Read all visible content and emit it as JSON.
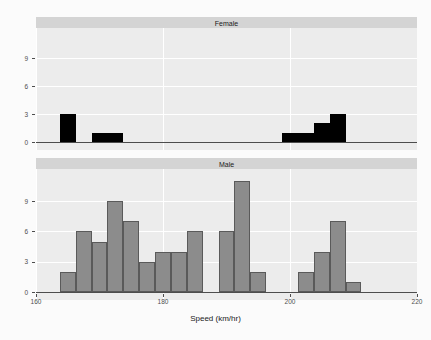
{
  "chart_data": {
    "type": "bar",
    "title": "",
    "subtitle": "",
    "xlabel": "Speed (km/hr)",
    "ylabel": "",
    "xlim": [
      160,
      220
    ],
    "ylim": [
      0,
      11.6
    ],
    "xticks": [
      160,
      180,
      200,
      220
    ],
    "yticks": [
      0,
      3,
      6,
      9
    ],
    "grid": true,
    "legend": "none",
    "facet_layout": "vertical-2-panel",
    "bin_width": 2.5,
    "panels": [
      {
        "label": "Female",
        "bar_color": "#000000",
        "bar_border": "#000000",
        "bins": [
          {
            "x0": 163.75,
            "x1": 166.25,
            "count": 3
          },
          {
            "x0": 166.25,
            "x1": 168.75,
            "count": 0
          },
          {
            "x0": 168.75,
            "x1": 171.25,
            "count": 1
          },
          {
            "x0": 171.25,
            "x1": 173.75,
            "count": 1
          },
          {
            "x0": 198.75,
            "x1": 201.25,
            "count": 1
          },
          {
            "x0": 201.25,
            "x1": 203.75,
            "count": 1
          },
          {
            "x0": 203.75,
            "x1": 206.25,
            "count": 2
          },
          {
            "x0": 206.25,
            "x1": 208.75,
            "count": 3
          }
        ],
        "values": [
          3,
          0,
          1,
          1,
          1,
          1,
          2,
          3
        ]
      },
      {
        "label": "Male",
        "bar_color": "#8c8c8c",
        "bar_border": "#5a5a5a",
        "bins": [
          {
            "x0": 163.75,
            "x1": 166.25,
            "count": 2
          },
          {
            "x0": 166.25,
            "x1": 168.75,
            "count": 6
          },
          {
            "x0": 168.75,
            "x1": 171.25,
            "count": 5
          },
          {
            "x0": 171.25,
            "x1": 173.75,
            "count": 9
          },
          {
            "x0": 173.75,
            "x1": 176.25,
            "count": 7
          },
          {
            "x0": 176.25,
            "x1": 178.75,
            "count": 3
          },
          {
            "x0": 178.75,
            "x1": 181.25,
            "count": 4
          },
          {
            "x0": 181.25,
            "x1": 183.75,
            "count": 4
          },
          {
            "x0": 183.75,
            "x1": 186.25,
            "count": 6
          },
          {
            "x0": 186.25,
            "x1": 188.75,
            "count": 0
          },
          {
            "x0": 188.75,
            "x1": 191.25,
            "count": 6
          },
          {
            "x0": 191.25,
            "x1": 193.75,
            "count": 11
          },
          {
            "x0": 193.75,
            "x1": 196.25,
            "count": 2
          },
          {
            "x0": 196.25,
            "x1": 198.75,
            "count": 0
          },
          {
            "x0": 198.75,
            "x1": 201.25,
            "count": 0
          },
          {
            "x0": 201.25,
            "x1": 203.75,
            "count": 2
          },
          {
            "x0": 203.75,
            "x1": 206.25,
            "count": 4
          },
          {
            "x0": 206.25,
            "x1": 208.75,
            "count": 7
          },
          {
            "x0": 208.75,
            "x1": 211.25,
            "count": 1
          }
        ],
        "values": [
          2,
          6,
          5,
          9,
          7,
          3,
          4,
          4,
          6,
          0,
          6,
          11,
          2,
          0,
          0,
          2,
          4,
          7,
          1
        ]
      }
    ]
  },
  "axis": {
    "x_title": "Speed (km/hr)",
    "x_tick_labels": [
      "160",
      "180",
      "200",
      "220"
    ],
    "y_tick_labels": [
      "0",
      "3",
      "6",
      "9"
    ]
  },
  "strips": {
    "female": "Female",
    "male": "Male"
  }
}
